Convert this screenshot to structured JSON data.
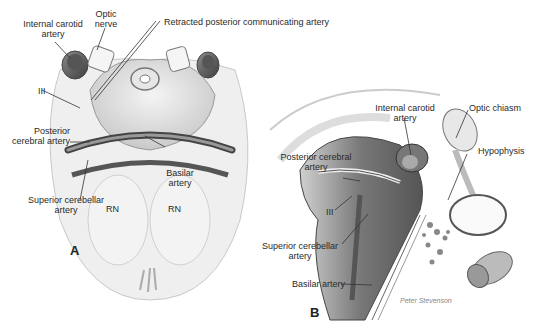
{
  "figure": {
    "panel_a": {
      "letter": "A",
      "labels": {
        "internal_carotid_1": "Internal carotid",
        "internal_carotid_2": "artery",
        "optic_nerve_1": "Optic",
        "optic_nerve_2": "nerve",
        "retracted_pcomm": "Retracted posterior communicating artery",
        "cn3": "III",
        "pca_1": "Posterior",
        "pca_2": "cerebral artery",
        "basilar_1": "Basilar",
        "basilar_2": "artery",
        "sca_1": "Superior cerebellar",
        "sca_2": "artery",
        "rn_left": "RN",
        "rn_right": "RN"
      }
    },
    "panel_b": {
      "letter": "B",
      "labels": {
        "internal_carotid_1": "Internal carotid",
        "internal_carotid_2": "artery",
        "optic_chiasm": "Optic chiasm",
        "hypophysis": "Hypophysis",
        "pca_1": "Posterior cerebral",
        "pca_2": "artery",
        "cn3": "III",
        "sca_1": "Superior cerebellar",
        "sca_2": "artery",
        "basilar": "Basilar artery",
        "signature": "Peter Stevenson"
      }
    }
  }
}
